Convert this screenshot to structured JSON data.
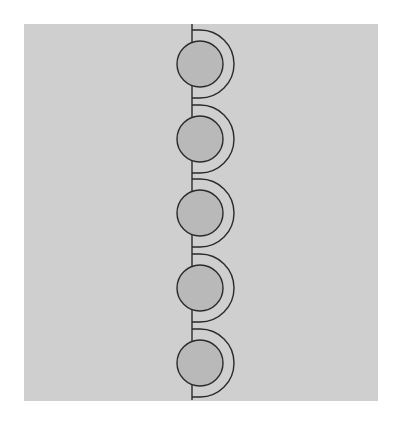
{
  "figure": {
    "width": 396,
    "height": 427,
    "page_background": "#ffffff",
    "panel": {
      "x": 24,
      "y": 24,
      "width": 354,
      "height": 377,
      "fill": "#cfcfcf"
    },
    "stroke_color": "#2a2a2a",
    "stroke_width": 1.4,
    "axis_line": {
      "x": 192,
      "y1": 24,
      "y2": 400
    },
    "units": [
      {
        "cy": 64,
        "label": "bead-1"
      },
      {
        "cy": 139,
        "label": "bead-2"
      },
      {
        "cy": 213,
        "label": "bead-3"
      },
      {
        "cy": 288,
        "label": "bead-4"
      },
      {
        "cy": 363,
        "label": "bead-5"
      }
    ],
    "bead": {
      "cx": 200,
      "r": 23,
      "fill": "#b9b9b9"
    },
    "shell": {
      "cx": 200,
      "r": 34
    }
  }
}
